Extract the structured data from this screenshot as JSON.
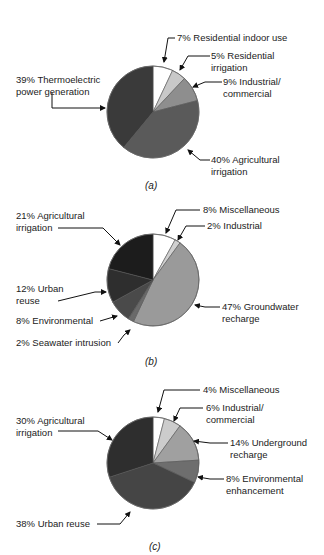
{
  "chart_data": [
    {
      "type": "pie",
      "title": "(a)",
      "categories": [
        "Residential indoor use",
        "Residential irrigation",
        "Industrial/commercial",
        "Agricultural irrigation",
        "Thermoelectric power generation"
      ],
      "values": [
        7,
        5,
        9,
        40,
        39
      ],
      "labels": [
        "7% Residential indoor use",
        "5% Residential irrigation",
        "9% Industrial/ commercial",
        "40% Agricultural irrigation",
        "39% Thermoelectric power generation"
      ],
      "colors": [
        "#ffffff",
        "#c8c8c8",
        "#8e8e8e",
        "#5a5a5a",
        "#3a3a3a"
      ]
    },
    {
      "type": "pie",
      "title": "(b)",
      "categories": [
        "Miscellaneous",
        "Industrial",
        "Groundwater recharge",
        "Seawater intrusion",
        "Environmental",
        "Urban reuse",
        "Agricultural irrigation"
      ],
      "values": [
        8,
        2,
        47,
        2,
        8,
        12,
        21
      ],
      "labels": [
        "8% Miscellaneous",
        "2% Industrial",
        "47% Groundwater recharge",
        "2% Seawater intrusion",
        "8% Environmental",
        "12% Urban reuse",
        "21% Agricultural irrigation"
      ],
      "colors": [
        "#ffffff",
        "#d0d0d0",
        "#9a9a9a",
        "#6a6a6a",
        "#4a4a4a",
        "#2e2e2e",
        "#1c1c1c"
      ]
    },
    {
      "type": "pie",
      "title": "(c)",
      "categories": [
        "Miscellaneous",
        "Industrial/commercial",
        "Underground recharge",
        "Environmental enhancement",
        "Urban reuse",
        "Agricultural irrigation"
      ],
      "values": [
        4,
        6,
        14,
        8,
        38,
        30
      ],
      "labels": [
        "4% Miscellaneous",
        "6% Industrial/ commercial",
        "14% Underground recharge",
        "8% Environmental enhancement",
        "38% Urban reuse",
        "30% Agricultural irrigation"
      ],
      "colors": [
        "#ffffff",
        "#cccccc",
        "#a0a0a0",
        "#6e6e6e",
        "#454545",
        "#2e2e2e"
      ]
    }
  ],
  "a": {
    "l1": "7% Residential indoor use",
    "l2a": "5% Residential",
    "l2b": "irrigation",
    "l3a": "9% Industrial/",
    "l3b": "commercial",
    "l4a": "40% Agricultural",
    "l4b": "irrigation",
    "l5a": "39% Thermoelectric",
    "l5b": "power generation",
    "caption": "(a)"
  },
  "b": {
    "l1": "8% Miscellaneous",
    "l2": "2% Industrial",
    "l3a": "47% Groundwater",
    "l3b": "recharge",
    "l4": "2% Seawater intrusion",
    "l5": "8% Environmental",
    "l6a": "12% Urban",
    "l6b": "reuse",
    "l7a": "21% Agricultural",
    "l7b": "irrigation",
    "caption": "(b)"
  },
  "c": {
    "l1": "4% Miscellaneous",
    "l2a": "6% Industrial/",
    "l2b": "commercial",
    "l3a": "14% Underground",
    "l3b": "recharge",
    "l4a": "8% Environmental",
    "l4b": "enhancement",
    "l5": "38% Urban reuse",
    "l6a": "30% Agricultural",
    "l6b": "irrigation",
    "caption": "(c)"
  }
}
